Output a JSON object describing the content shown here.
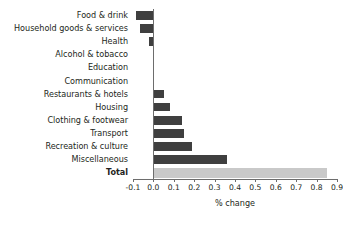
{
  "chart_data": {
    "type": "bar",
    "orientation": "horizontal",
    "title": "",
    "xlabel": "% change",
    "ylabel": "",
    "xlim": [
      -0.1,
      0.9
    ],
    "xticks": [
      -0.1,
      0.0,
      0.1,
      0.2,
      0.3,
      0.4,
      0.5,
      0.6,
      0.7,
      0.8,
      0.9
    ],
    "xtick_labels": [
      "-0.1",
      "0.0",
      "0.1",
      "0.2",
      "0.3",
      "0.4",
      "0.5",
      "0.6",
      "0.7",
      "0.8",
      "0.9"
    ],
    "grid": false,
    "legend": null,
    "categories": [
      "Food & drink",
      "Household goods & services",
      "Health",
      "Alcohol & tobacco",
      "Education",
      "Communication",
      "Restaurants & hotels",
      "Housing",
      "Clothing & footwear",
      "Transport",
      "Recreation & culture",
      "Miscellaneous",
      "Total"
    ],
    "values": [
      -0.085,
      -0.065,
      -0.02,
      -0.003,
      0.0,
      0.003,
      0.05,
      0.08,
      0.14,
      0.15,
      0.19,
      0.36,
      0.85
    ],
    "series": [
      {
        "name": "% change",
        "values": [
          -0.085,
          -0.065,
          -0.02,
          -0.003,
          0.0,
          0.003,
          0.05,
          0.08,
          0.14,
          0.15,
          0.19,
          0.36,
          0.85
        ]
      }
    ],
    "bar_color": "#3f3f3f",
    "total_bar_color": "#c9c9c9",
    "axis_color": "#6d6d6d",
    "background": "#ffffff"
  }
}
